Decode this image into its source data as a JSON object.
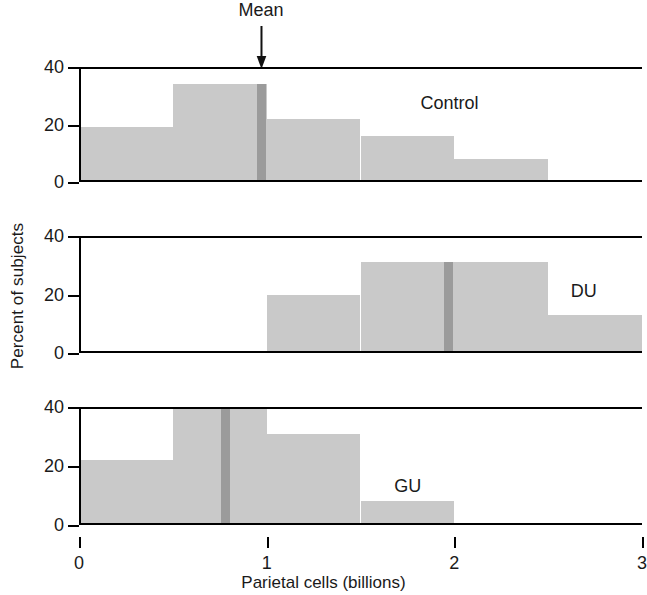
{
  "chart_data": {
    "type": "bar",
    "title": "",
    "xlabel": "Parietal cells (billions)",
    "ylabel": "Percent of subjects",
    "xlim": [
      0,
      3
    ],
    "ylim": [
      0,
      40
    ],
    "xticks": [
      "0",
      "1",
      "2",
      "3"
    ],
    "xtick_values": [
      0,
      1,
      2,
      3
    ],
    "yticks": [
      "0",
      "20",
      "40"
    ],
    "ytick_values": [
      0,
      20,
      40
    ],
    "grid": false,
    "bin_width": 0.5,
    "annotation": "Mean",
    "bar_color": "#c9c9c9",
    "mean_color": "#9b9b9b",
    "axis_color": "#000000",
    "panels": [
      {
        "label": "Control",
        "label_x": 1.82,
        "label_y": 27,
        "mean": 0.97,
        "bins": [
          {
            "x0": 0.0,
            "x1": 0.5,
            "value": 19
          },
          {
            "x0": 0.5,
            "x1": 1.0,
            "value": 34
          },
          {
            "x0": 1.0,
            "x1": 1.5,
            "value": 22
          },
          {
            "x0": 1.5,
            "x1": 2.0,
            "value": 16
          },
          {
            "x0": 2.0,
            "x1": 2.5,
            "value": 8
          }
        ]
      },
      {
        "label": "DU",
        "label_x": 2.62,
        "label_y": 21,
        "mean": 1.97,
        "bins": [
          {
            "x0": 1.0,
            "x1": 1.5,
            "value": 20
          },
          {
            "x0": 1.5,
            "x1": 2.0,
            "value": 31
          },
          {
            "x0": 2.0,
            "x1": 2.5,
            "value": 31
          },
          {
            "x0": 2.5,
            "x1": 3.0,
            "value": 13
          }
        ]
      },
      {
        "label": "GU",
        "label_x": 1.68,
        "label_y": 13,
        "mean": 0.78,
        "bins": [
          {
            "x0": 0.0,
            "x1": 0.5,
            "value": 22
          },
          {
            "x0": 0.5,
            "x1": 1.0,
            "value": 40
          },
          {
            "x0": 1.0,
            "x1": 1.5,
            "value": 31
          },
          {
            "x0": 1.5,
            "x1": 2.0,
            "value": 8
          }
        ]
      }
    ]
  },
  "panel_geometry": [
    {
      "top": 67,
      "height": 115
    },
    {
      "top": 236,
      "height": 117
    },
    {
      "top": 407,
      "height": 118
    }
  ]
}
